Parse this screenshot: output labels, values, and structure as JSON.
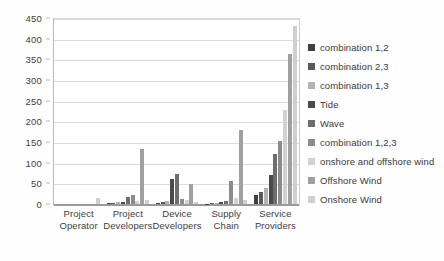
{
  "chart_data": {
    "type": "bar",
    "title": "",
    "xlabel": "",
    "ylabel": "",
    "ylim": [
      0,
      450
    ],
    "yticks": [
      0,
      50,
      100,
      150,
      200,
      250,
      300,
      350,
      400,
      450
    ],
    "ytick_labels": [
      "0",
      "50",
      "100",
      "150",
      "200",
      "250",
      "300",
      "350",
      "400",
      "450"
    ],
    "grid": true,
    "legend_position": "right",
    "categories": [
      "Project Operator",
      "Project Developers",
      "Device Developers",
      "Supply Chain",
      "Service Providers"
    ],
    "category_lines": [
      [
        "Project",
        "Operator"
      ],
      [
        "Project",
        "Developers"
      ],
      [
        "Device",
        "Developers"
      ],
      [
        "Supply",
        "Chain"
      ],
      [
        "Service",
        "Providers"
      ]
    ],
    "series": [
      {
        "name": "combination 1,2",
        "color": "#3f3f3f",
        "values": [
          0,
          2,
          3,
          1,
          22
        ]
      },
      {
        "name": "combination 2,3",
        "color": "#585858",
        "values": [
          0,
          3,
          5,
          2,
          30
        ]
      },
      {
        "name": "combination 1,3",
        "color": "#b4b4b4",
        "values": [
          0,
          4,
          8,
          3,
          38
        ]
      },
      {
        "name": "Tide",
        "color": "#4a4a4a",
        "values": [
          0,
          6,
          60,
          4,
          70
        ]
      },
      {
        "name": "Wave",
        "color": "#6e6e6e",
        "values": [
          0,
          18,
          72,
          8,
          120
        ]
      },
      {
        "name": "combination 1,2,3",
        "color": "#8c8c8c",
        "values": [
          0,
          22,
          12,
          56,
          152
        ]
      },
      {
        "name": "onshore and offshore wind",
        "color": "#d2d2d2",
        "values": [
          0,
          8,
          10,
          14,
          228
        ]
      },
      {
        "name": "Offshore Wind",
        "color": "#a0a0a0",
        "values": [
          0,
          132,
          48,
          178,
          362
        ]
      },
      {
        "name": "Onshore Wind",
        "color": "#cfcfcf",
        "values": [
          14,
          9,
          6,
          10,
          430
        ]
      }
    ]
  },
  "legend": {
    "items": [
      "combination 1,2",
      "combination 2,3",
      "combination 1,3",
      "Tide",
      "Wave",
      "combination 1,2,3",
      "onshore and offshore wind",
      "Offshore Wind",
      "Onshore Wind"
    ]
  }
}
